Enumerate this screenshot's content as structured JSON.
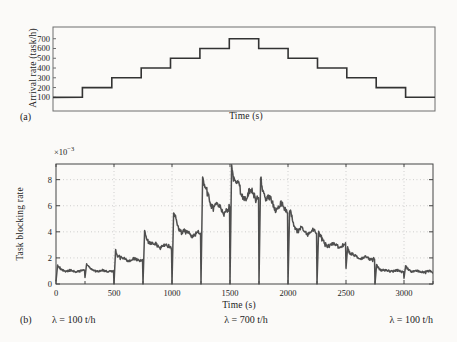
{
  "figure": {
    "panel_a": {
      "tag": "(a)",
      "ylabel": "Arrival rate (task/h)",
      "xlabel": "Time (s)"
    },
    "panel_b": {
      "tag": "(b)",
      "ylabel": "Task blocking rate",
      "xlabel": "Time (s)",
      "scale_base": "×10",
      "scale_exp": "−3"
    },
    "annotations": {
      "left": "λ = 100 t/h",
      "center": "λ = 700 t/h",
      "right": "λ = 100 t/h"
    }
  },
  "colors": {
    "background": "#fbfaf8",
    "frame_a": "#6e6e6e",
    "frame_b": "#454545",
    "staircase": "#333333",
    "curve": "#4f4f4f",
    "grid": "#b4b4b4",
    "text": "#1c1c1c"
  },
  "chart_data": [
    {
      "type": "line",
      "style": "staircase",
      "panel": "a",
      "xlabel": "Time (s)",
      "ylabel": "Arrival rate (task/h)",
      "xlim": [
        0,
        3250
      ],
      "ylim": [
        -40,
        820
      ],
      "yticks": [
        100,
        200,
        300,
        400,
        500,
        600,
        700
      ],
      "step_duration_s": 250,
      "step_values_task_per_h": [
        100,
        200,
        300,
        400,
        500,
        600,
        700,
        600,
        500,
        400,
        300,
        200,
        100
      ],
      "grid": "off",
      "x_tick_labels": "none"
    },
    {
      "type": "line",
      "style": "noisy-transient",
      "panel": "b",
      "xlabel": "Time (s)",
      "ylabel": "Task blocking rate",
      "value_scale": "1e-3",
      "xlim": [
        0,
        3250
      ],
      "ylim": [
        0,
        9.2
      ],
      "xticks": [
        0,
        500,
        1000,
        1500,
        2000,
        2500,
        3000
      ],
      "minor_xtick_step": 250,
      "yticks": [
        0,
        2,
        4,
        6,
        8
      ],
      "grid": "dotted",
      "segments": [
        {
          "t0": 0,
          "t1": 250,
          "lambda_t_per_h": 100,
          "drop": 0.2,
          "peak": 1.45,
          "settle": 1.0
        },
        {
          "t0": 250,
          "t1": 500,
          "lambda_t_per_h": 200,
          "drop": 0.5,
          "peak": 1.55,
          "settle": 1.0
        },
        {
          "t0": 500,
          "t1": 750,
          "lambda_t_per_h": 300,
          "drop": 0.0,
          "peak": 2.65,
          "settle": 1.85
        },
        {
          "t0": 750,
          "t1": 1000,
          "lambda_t_per_h": 400,
          "drop": 0.0,
          "peak": 4.1,
          "settle": 2.9
        },
        {
          "t0": 1000,
          "t1": 1250,
          "lambda_t_per_h": 500,
          "drop": 0.0,
          "peak": 5.45,
          "settle": 3.8
        },
        {
          "t0": 1250,
          "t1": 1500,
          "lambda_t_per_h": 600,
          "drop": 0.0,
          "peak": 8.2,
          "settle": 5.65
        },
        {
          "t0": 1500,
          "t1": 1750,
          "lambda_t_per_h": 700,
          "drop": 0.0,
          "peak": 9.15,
          "settle": 6.4,
          "bump": {
            "t": 1705,
            "h": 0.55,
            "w": 30
          }
        },
        {
          "t0": 1750,
          "t1": 2000,
          "lambda_t_per_h": 600,
          "drop": 0.0,
          "peak": 8.1,
          "settle": 5.85
        },
        {
          "t0": 2000,
          "t1": 2250,
          "lambda_t_per_h": 500,
          "drop": 0.0,
          "peak": 5.6,
          "settle": 3.95
        },
        {
          "t0": 2250,
          "t1": 2500,
          "lambda_t_per_h": 400,
          "drop": 0.0,
          "peak": 4.05,
          "settle": 2.95
        },
        {
          "t0": 2500,
          "t1": 2750,
          "lambda_t_per_h": 300,
          "drop": 1.2,
          "peak": 2.85,
          "settle": 2.0
        },
        {
          "t0": 2750,
          "t1": 3000,
          "lambda_t_per_h": 200,
          "drop": 0.0,
          "peak": 1.5,
          "settle": 1.0
        },
        {
          "t0": 3000,
          "t1": 3250,
          "lambda_t_per_h": 100,
          "drop": 0.45,
          "peak": 1.4,
          "settle": 0.95
        }
      ]
    }
  ]
}
